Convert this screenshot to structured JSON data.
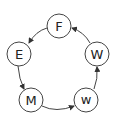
{
  "diagram": {
    "type": "cycle",
    "nodes": [
      {
        "id": "F",
        "label": "F",
        "cx": 59,
        "cy": 26,
        "r": 12
      },
      {
        "id": "E",
        "label": "E",
        "cx": 19,
        "cy": 54,
        "r": 12
      },
      {
        "id": "M",
        "label": "M",
        "cx": 31,
        "cy": 100,
        "r": 12
      },
      {
        "id": "w",
        "label": "w",
        "cx": 86,
        "cy": 100,
        "r": 12
      },
      {
        "id": "W",
        "label": "W",
        "cx": 97,
        "cy": 54,
        "r": 12
      }
    ],
    "edges": [
      {
        "from": "F",
        "to": "E"
      },
      {
        "from": "E",
        "to": "M"
      },
      {
        "from": "M",
        "to": "w"
      },
      {
        "from": "w",
        "to": "W"
      },
      {
        "from": "W",
        "to": "F"
      }
    ],
    "colors": {
      "stroke": "#444444",
      "text": "#222222",
      "background": "#ffffff"
    }
  }
}
